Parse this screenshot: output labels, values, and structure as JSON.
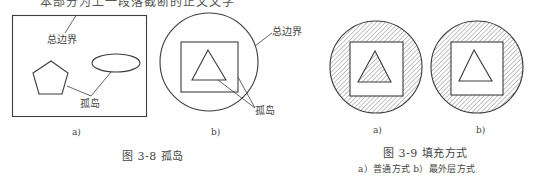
{
  "cutoff_line": "本部分为上一段落截断的正文文字",
  "figure_3_8": {
    "caption": "图 3-8    孤岛",
    "panel_a": {
      "sublabel": "a)",
      "outer_boundary_label": "总边界",
      "island_label": "孤岛"
    },
    "panel_b": {
      "sublabel": "b)",
      "outer_boundary_label": "总边界",
      "island_label": "孤岛"
    }
  },
  "figure_3_9": {
    "caption": "图 3-9    填充方式",
    "subcaption": "a）普通方式   b）最外层方式",
    "panel_a": {
      "sublabel": "a)",
      "mode": "普通方式"
    },
    "panel_b": {
      "sublabel": "b)",
      "mode": "最外层方式"
    }
  },
  "colors": {
    "stroke": "#3c3c3c",
    "hatch": "#7a7a7a",
    "background": "#ffffff"
  }
}
